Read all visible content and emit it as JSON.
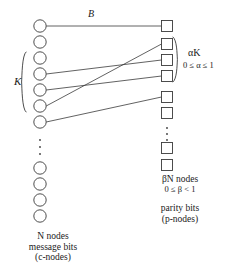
{
  "diagram": {
    "title_label_top": "B",
    "left_group_brace_label": "K",
    "right_group_brace_label": "αK",
    "right_group_range": "0 ≤ α ≤ 1",
    "left_caption": {
      "line1": "N nodes",
      "line2": "message bits",
      "line3": "(c-nodes)"
    },
    "right_caption": {
      "line1": "βN nodes",
      "line2": "0 ≤ β <  1",
      "line3": "parity bits",
      "line4": "(p-nodes)"
    },
    "colors": {
      "stroke": "#3a3a3a",
      "node_fill": "#ffffff",
      "text": "#1a1a1a",
      "background": "#ffffff"
    },
    "left_nodes": {
      "shape": "circle",
      "name": "c-node",
      "radius": 6.2,
      "cx": 40,
      "cy_values": [
        26,
        42,
        58,
        74,
        90,
        106,
        122,
        168,
        184,
        200,
        216
      ],
      "ellipsis_y": [
        140,
        147,
        154
      ]
    },
    "right_nodes": {
      "shape": "square",
      "name": "p-node",
      "size": 11,
      "cx": 167,
      "cy_values": [
        26,
        44,
        60,
        76,
        97,
        113,
        148,
        165
      ],
      "ellipsis_y": [
        128,
        134,
        140
      ]
    },
    "edges": [
      {
        "from": 0,
        "to": 0
      },
      {
        "from": 3,
        "to": 2
      },
      {
        "from": 4,
        "to": 3
      },
      {
        "from": 5,
        "to": 1
      },
      {
        "from": 6,
        "to": 4
      }
    ],
    "left_brace": {
      "label": "K",
      "y_top": 52,
      "y_bottom": 112,
      "x": 22
    },
    "right_brace": {
      "label": "αK",
      "y_top": 37,
      "y_bottom": 82,
      "x": 177
    }
  }
}
